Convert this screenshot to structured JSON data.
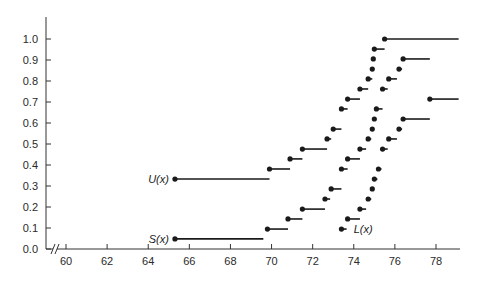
{
  "chart_data": {
    "type": "line",
    "subtype": "step",
    "title": "",
    "xlabel": "",
    "ylabel": "",
    "xlim": [
      59.5,
      79.2
    ],
    "ylim": [
      0.0,
      1.1
    ],
    "x_axis_break": true,
    "grid": false,
    "legend": "inline labels",
    "x_ticks": [
      60,
      62,
      64,
      66,
      68,
      70,
      72,
      74,
      76,
      78
    ],
    "x_tick_labels": [
      "60",
      "62",
      "64",
      "66",
      "68",
      "70",
      "72",
      "74",
      "76",
      "78"
    ],
    "y_ticks": [
      0.0,
      0.1,
      0.2,
      0.3,
      0.4,
      0.5,
      0.6,
      0.7,
      0.8,
      0.9,
      1.0
    ],
    "y_tick_labels": [
      "0.0",
      "0.1",
      "0.2",
      "0.3",
      "0.4",
      "0.5",
      "0.6",
      "0.7",
      "0.8",
      "0.9",
      "1.0"
    ],
    "series": [
      {
        "name": "U(x)",
        "label": "U(x)",
        "label_position": {
          "x": 65.3,
          "y": 0.333,
          "anchor": "left"
        },
        "steps": [
          {
            "x": 65.3,
            "x_end": 69.9,
            "y": 0.333
          },
          {
            "x": 69.9,
            "x_end": 70.9,
            "y": 0.381
          },
          {
            "x": 70.9,
            "x_end": 71.5,
            "y": 0.429
          },
          {
            "x": 71.5,
            "x_end": 72.7,
            "y": 0.476
          },
          {
            "x": 72.7,
            "x_end": 72.9,
            "y": 0.524
          },
          {
            "x": 73.0,
            "x_end": 73.4,
            "y": 0.571
          },
          {
            "x": 73.4,
            "x_end": 73.7,
            "y": 0.667
          },
          {
            "x": 73.7,
            "x_end": 74.3,
            "y": 0.714
          },
          {
            "x": 74.3,
            "x_end": 74.7,
            "y": 0.762
          },
          {
            "x": 74.7,
            "x_end": 74.9,
            "y": 0.81
          },
          {
            "x": 74.9,
            "x_end": 74.95,
            "y": 0.857
          },
          {
            "x": 74.95,
            "x_end": 75.0,
            "y": 0.905
          },
          {
            "x": 75.0,
            "x_end": 75.5,
            "y": 0.952
          },
          {
            "x": 75.5,
            "x_end": 79.1,
            "y": 1.0
          }
        ]
      },
      {
        "name": "S(x)",
        "label": "S(x)",
        "label_position": {
          "x": 65.3,
          "y": 0.048,
          "anchor": "left"
        },
        "steps": [
          {
            "x": 65.3,
            "x_end": 69.6,
            "y": 0.048
          },
          {
            "x": 69.8,
            "x_end": 70.8,
            "y": 0.095
          },
          {
            "x": 70.8,
            "x_end": 71.5,
            "y": 0.143
          },
          {
            "x": 71.5,
            "x_end": 72.6,
            "y": 0.19
          },
          {
            "x": 72.6,
            "x_end": 72.85,
            "y": 0.238
          },
          {
            "x": 72.9,
            "x_end": 73.4,
            "y": 0.286
          },
          {
            "x": 73.4,
            "x_end": 73.7,
            "y": 0.381
          },
          {
            "x": 73.7,
            "x_end": 74.3,
            "y": 0.429
          },
          {
            "x": 74.3,
            "x_end": 74.6,
            "y": 0.476
          },
          {
            "x": 74.7,
            "x_end": 74.85,
            "y": 0.524
          },
          {
            "x": 74.9,
            "x_end": 74.98,
            "y": 0.571
          },
          {
            "x": 75.0,
            "x_end": 75.08,
            "y": 0.619
          },
          {
            "x": 75.1,
            "x_end": 75.4,
            "y": 0.667
          },
          {
            "x": 75.4,
            "x_end": 75.65,
            "y": 0.762
          },
          {
            "x": 75.7,
            "x_end": 76.1,
            "y": 0.81
          },
          {
            "x": 76.2,
            "x_end": 76.35,
            "y": 0.857
          },
          {
            "x": 76.4,
            "x_end": 77.7,
            "y": 0.905
          }
        ]
      },
      {
        "name": "L(x)",
        "label": "L(x)",
        "label_position": {
          "x": 73.9,
          "y": 0.095,
          "anchor": "left"
        },
        "steps": [
          {
            "x": 73.4,
            "x_end": 73.65,
            "y": 0.095
          },
          {
            "x": 73.7,
            "x_end": 74.3,
            "y": 0.143
          },
          {
            "x": 74.3,
            "x_end": 74.6,
            "y": 0.19
          },
          {
            "x": 74.7,
            "x_end": 74.85,
            "y": 0.238
          },
          {
            "x": 74.9,
            "x_end": 74.98,
            "y": 0.286
          },
          {
            "x": 75.0,
            "x_end": 75.15,
            "y": 0.333
          },
          {
            "x": 75.2,
            "x_end": 75.35,
            "y": 0.381
          },
          {
            "x": 75.4,
            "x_end": 75.65,
            "y": 0.476
          },
          {
            "x": 75.7,
            "x_end": 76.1,
            "y": 0.524
          },
          {
            "x": 76.2,
            "x_end": 76.35,
            "y": 0.571
          },
          {
            "x": 76.4,
            "x_end": 77.7,
            "y": 0.619
          },
          {
            "x": 77.7,
            "x_end": 79.1,
            "y": 0.714
          }
        ]
      }
    ]
  },
  "layout": {
    "plot_origin_px": {
      "x": 46,
      "y": 249
    },
    "x_axis": {
      "value_at_px": [
        [
          60,
          66
        ],
        [
          78,
          436
        ]
      ],
      "end_px": 460
    },
    "y_axis": {
      "value_at_px": [
        [
          0.0,
          249
        ],
        [
          1.0,
          39
        ]
      ],
      "top_px": 17
    }
  }
}
